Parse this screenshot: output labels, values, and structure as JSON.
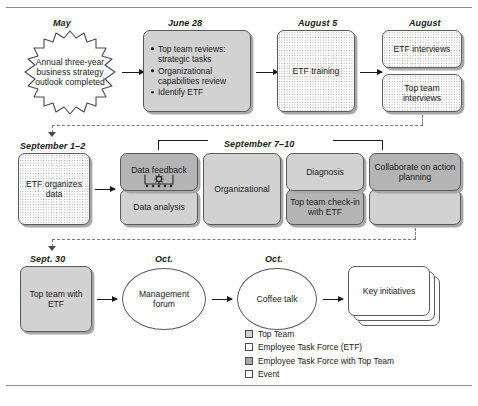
{
  "figure": {
    "title_rules": true
  },
  "captions": {
    "may": "May",
    "june28": "June 28",
    "august5": "August 5",
    "august": "August",
    "september12": "September 1–2",
    "september710": "September 7–10",
    "sept30": "Sept. 30",
    "oct1": "Oct.",
    "oct2": "Oct."
  },
  "nodes": {
    "annual_outlook": "Annual three-year business strategy outlook completed",
    "june_bullets": [
      "Top team reviews: strategic tasks",
      "Organizational capabilities review",
      "Identify ETF"
    ],
    "etf_training": "ETF training",
    "etf_interviews": "ETF interviews",
    "top_team_interviews": "Top team interviews",
    "etf_organizes_data": "ETF organizes data",
    "data_feedback": "Data feedback",
    "data_analysis": "Data analysis",
    "organizational": "Organizational",
    "diagnosis": "Diagnosis",
    "top_team_checkin": "Top team check-in with ETF",
    "collaborate": "Collaborate on action planning",
    "top_team_with_etf": "Top team with ETF",
    "management_forum": "Management forum",
    "coffee_talk": "Coffee talk",
    "key_initiatives": "Key initiatives"
  },
  "icons": {
    "meeting_gear": "meeting-gear-icon"
  },
  "legend": {
    "items": [
      {
        "label": "Top Team",
        "swatch": "gray"
      },
      {
        "label": "Employee Task Force (ETF)",
        "swatch": "white"
      },
      {
        "label": "Employee Task Force with Top Team",
        "swatch": "darkgray"
      },
      {
        "label": "Event",
        "swatch": "white"
      }
    ]
  },
  "colors": {
    "top_team_fill": "#d2d2d2",
    "etf_with_top_team_fill": "#b4b4b4",
    "etf_fill": "#fdfdfd",
    "event_fill": "#ffffff",
    "outline": "#595959",
    "shadow": "#a8a8a8"
  }
}
